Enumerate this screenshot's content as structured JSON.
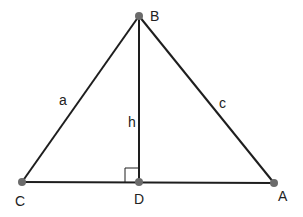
{
  "diagram": {
    "type": "triangle-with-altitude",
    "colors": {
      "line": "#1e1e1e",
      "point": "#6b6b6b",
      "text": "#222222",
      "background": "#ffffff"
    },
    "points": [
      {
        "id": "B",
        "label": "B",
        "x": 139,
        "y": 16,
        "label_x": 150,
        "label_y": 21
      },
      {
        "id": "C",
        "label": "C",
        "x": 22,
        "y": 182,
        "label_x": 15,
        "label_y": 206
      },
      {
        "id": "D",
        "label": "D",
        "x": 139,
        "y": 182,
        "label_x": 134,
        "label_y": 204
      },
      {
        "id": "A",
        "label": "A",
        "x": 274,
        "y": 183,
        "label_x": 278,
        "label_y": 201
      }
    ],
    "segments": [
      {
        "from": "C",
        "to": "B",
        "label": "a",
        "label_x": 59,
        "label_y": 105
      },
      {
        "from": "B",
        "to": "A",
        "label": "c",
        "label_x": 219,
        "label_y": 108
      },
      {
        "from": "B",
        "to": "D",
        "label": "h",
        "label_x": 128,
        "label_y": 127
      },
      {
        "from": "C",
        "to": "A",
        "label": ""
      }
    ],
    "right_angle": {
      "at": "D",
      "size": 14
    }
  }
}
